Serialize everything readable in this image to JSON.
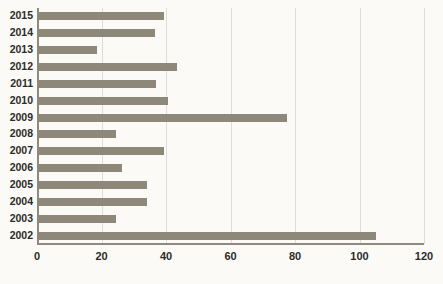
{
  "chart_data": {
    "type": "bar",
    "orientation": "horizontal",
    "title": "",
    "subtitle": "",
    "xlabel": "",
    "ylabel": "",
    "xlim": [
      0,
      120
    ],
    "xticks": [
      0,
      20,
      40,
      60,
      80,
      100,
      120
    ],
    "xtick_labels": [
      "0",
      "20",
      "40",
      "60",
      "80",
      "100",
      "120"
    ],
    "grid": true,
    "grid_axis": "x",
    "legend": false,
    "legend_position": "none",
    "categories": [
      "2015",
      "2014",
      "2013",
      "2012",
      "2011",
      "2010",
      "2009",
      "2008",
      "2007",
      "2006",
      "2005",
      "2004",
      "2003",
      "2002"
    ],
    "values": [
      39.5,
      36.5,
      18.5,
      43.5,
      37,
      40.5,
      77.5,
      24.5,
      39.5,
      26.5,
      34,
      34,
      24.5,
      105
    ],
    "series": [
      {
        "name": "",
        "values": [
          39.5,
          36.5,
          18.5,
          43.5,
          37,
          40.5,
          77.5,
          24.5,
          39.5,
          26.5,
          34,
          34,
          24.5,
          105
        ]
      }
    ],
    "annotations": []
  },
  "style": {
    "background_color": "#fbfaf6",
    "bar_color": "#8d887a",
    "gridline_color": "#ddddd4",
    "axis_color": "#8f8a7d",
    "text_color": "#2b2b29"
  }
}
